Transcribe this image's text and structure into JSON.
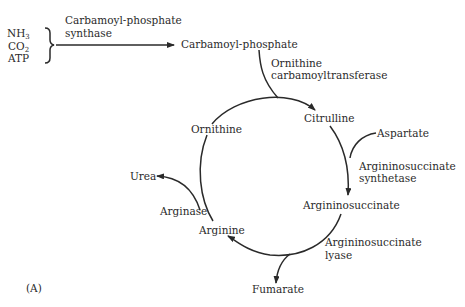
{
  "diagram": {
    "panel_label": "(A)",
    "inputs": {
      "nh3": {
        "base": "NH",
        "sub": "3"
      },
      "co2": {
        "base": "CO",
        "sub": "2"
      },
      "atp": "ATP"
    },
    "nodes": {
      "carbamoyl_phosphate": "Carbamoyl-phosphate",
      "citrulline": "Citrulline",
      "aspartate": "Aspartate",
      "argininosuccinate": "Argininosuccinate",
      "fumarate": "Fumarate",
      "arginine": "Arginine",
      "urea": "Urea",
      "ornithine": "Ornithine"
    },
    "enzymes": {
      "cps": [
        "Carbamoyl-phosphate",
        "synthase"
      ],
      "otc": [
        "Ornithine",
        "carbamoyltransferase"
      ],
      "ass": [
        "Argininosuccinate",
        "synthetase"
      ],
      "asl": [
        "Argininosuccinate",
        "lyase"
      ],
      "arginase": "Arginase"
    },
    "colors": {
      "line": "#2a2a2a",
      "text": "#2a2a2a",
      "background": "#ffffff"
    }
  }
}
